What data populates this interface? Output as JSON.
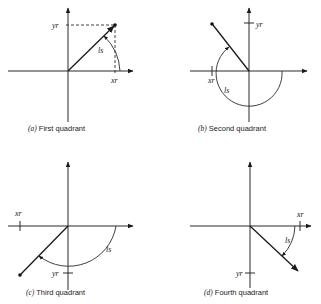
{
  "figure": {
    "panels": [
      {
        "id": "a",
        "caption_letter": "(a)",
        "caption_text": " First quadrant",
        "x_label": "xr",
        "y_label": "yr",
        "angle_label": "ls"
      },
      {
        "id": "b",
        "caption_letter": "(b)",
        "caption_text": " Second quadrant",
        "x_label": "xr",
        "y_label": "yr",
        "angle_label": "ls"
      },
      {
        "id": "c",
        "caption_letter": "(c)",
        "caption_text": " Third quadrant",
        "x_label": "xr",
        "y_label": "yr",
        "angle_label": "ls"
      },
      {
        "id": "d",
        "caption_letter": "(d)",
        "caption_text": " Fourth quadrant",
        "x_label": "xr",
        "y_label": "yr",
        "angle_label": "ls"
      }
    ]
  }
}
